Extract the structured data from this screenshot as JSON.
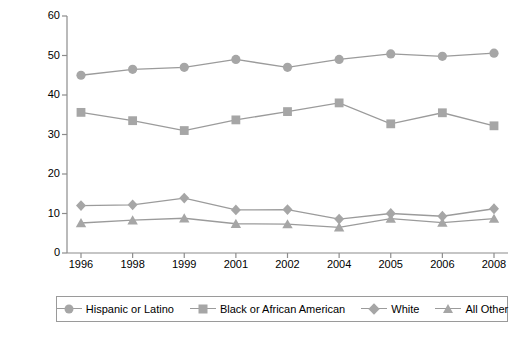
{
  "chart_data": {
    "type": "line",
    "title": "",
    "subtitle": "",
    "xlabel": "",
    "ylabel": "Percent",
    "categories": [
      "1996",
      "1998",
      "1999",
      "2001",
      "2002",
      "2004",
      "2005",
      "2006",
      "2008"
    ],
    "ylim": [
      0,
      60
    ],
    "yticks": [
      0,
      10,
      20,
      30,
      40,
      50,
      60
    ],
    "grid": false,
    "legend_position": "bottom",
    "series": [
      {
        "name": "Hispanic or Latino",
        "marker": "circle",
        "color": "#a6a6a6",
        "values": [
          45.0,
          46.5,
          47.0,
          49.0,
          47.0,
          49.0,
          50.4,
          49.8,
          50.6
        ]
      },
      {
        "name": "Black or African American",
        "marker": "square",
        "color": "#a6a6a6",
        "values": [
          35.6,
          33.5,
          31.0,
          33.7,
          35.8,
          38.0,
          32.7,
          35.5,
          32.2
        ]
      },
      {
        "name": "White",
        "marker": "diamond",
        "color": "#a6a6a6",
        "values": [
          12.0,
          12.2,
          13.9,
          10.9,
          11.0,
          8.6,
          10.0,
          9.3,
          11.2
        ]
      },
      {
        "name": "All Other",
        "marker": "triangle",
        "color": "#a6a6a6",
        "values": [
          7.6,
          8.3,
          8.8,
          7.4,
          7.3,
          6.5,
          8.7,
          7.7,
          8.7
        ]
      }
    ]
  },
  "axis": {
    "y_label": "Percent",
    "y_ticks": [
      "0",
      "10",
      "20",
      "30",
      "40",
      "50",
      "60"
    ],
    "x_ticks": [
      "1996",
      "1998",
      "1999",
      "2001",
      "2002",
      "2004",
      "2005",
      "2006",
      "2008"
    ]
  },
  "legend": {
    "items": [
      {
        "label": "Hispanic or Latino",
        "marker": "circle"
      },
      {
        "label": "Black or African American",
        "marker": "square"
      },
      {
        "label": "White",
        "marker": "diamond"
      },
      {
        "label": "All Other",
        "marker": "triangle"
      }
    ]
  },
  "colors": {
    "series": "#a6a6a6",
    "line": "#9b9b9b",
    "axis": "#8c8c8c",
    "text": "#000000",
    "legend_border": "#9a9a9a",
    "background": "#ffffff"
  }
}
